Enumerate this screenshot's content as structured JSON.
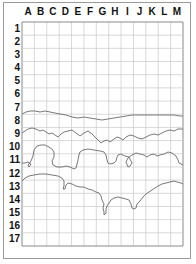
{
  "grid": {
    "columns": [
      "A",
      "B",
      "C",
      "D",
      "E",
      "F",
      "G",
      "H",
      "I",
      "J",
      "K",
      "L",
      "M"
    ],
    "rows": [
      "1",
      "2",
      "3",
      "4",
      "5",
      "6",
      "7",
      "8",
      "9",
      "10",
      "11",
      "12",
      "13",
      "14",
      "15",
      "16",
      "17"
    ],
    "line_color": "#c8c8c8",
    "border_color": "#8a8a8a",
    "contour_color": "#6a6a6a"
  }
}
